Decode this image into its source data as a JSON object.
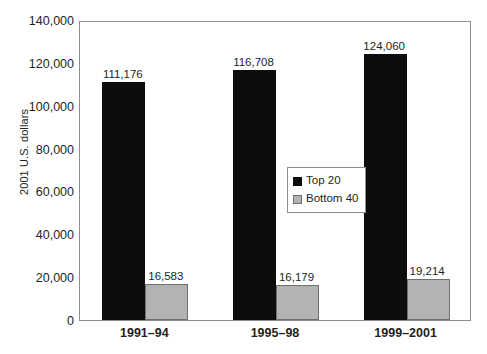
{
  "chart_data": {
    "type": "bar",
    "title": "",
    "xlabel": "",
    "ylabel": "2001 U.S. dollars",
    "categories": [
      "1991–94",
      "1995–98",
      "1999–2001"
    ],
    "series": [
      {
        "name": "Top 20",
        "color": "#0d0d0d",
        "values": [
          111176,
          116708,
          124060
        ],
        "labels": [
          "111,176",
          "116,708",
          "124,060"
        ]
      },
      {
        "name": "Bottom 40",
        "color": "#b3b3b3",
        "values": [
          16583,
          16179,
          19214
        ],
        "labels": [
          "16,583",
          "16,179",
          "19,214"
        ]
      }
    ],
    "ylim": [
      0,
      140000
    ],
    "ytick_values": [
      0,
      20000,
      40000,
      60000,
      80000,
      100000,
      120000,
      140000
    ],
    "ytick_labels": [
      "0",
      "20,000",
      "40,000",
      "60,000",
      "80,000",
      "100,000",
      "120,000",
      "140,000"
    ],
    "grid": false,
    "legend_position": "center"
  },
  "axis": {
    "y_title": "2001 U.S. dollars"
  },
  "legend": {
    "items": [
      {
        "label": "Top 20",
        "swatch": "black-swatch-icon"
      },
      {
        "label": "Bottom 40",
        "swatch": "gray-swatch-icon"
      }
    ]
  }
}
